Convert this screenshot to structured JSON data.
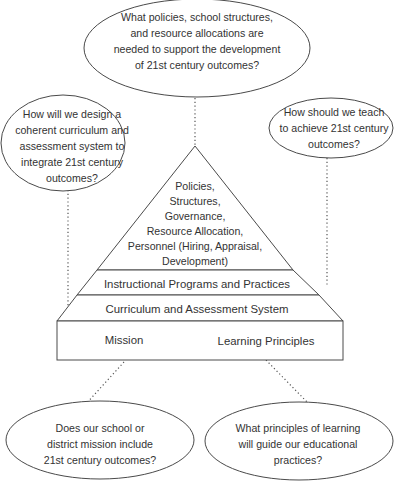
{
  "diagram": {
    "questions": {
      "top": [
        "What policies, school structures,",
        "and resource allocations are",
        "needed to support the development",
        "of 21st century outcomes?"
      ],
      "left": [
        "How will we design a",
        "coherent curriculum and",
        "assessment system to",
        "integrate 21st century",
        "outcomes?"
      ],
      "right": [
        "How should we teach",
        "to achieve 21st century",
        "outcomes?"
      ],
      "bottom_left": [
        "Does our school or",
        "district mission include",
        "21st century outcomes?"
      ],
      "bottom_right": [
        "What principles of learning",
        "will guide our educational",
        "practices?"
      ]
    },
    "pyramid": {
      "apex": [
        "Policies,",
        "Structures,",
        "Governance,",
        "Resource Allocation,",
        "Personnel (Hiring, Appraisal,",
        "Development)"
      ],
      "layer2": "Instructional Programs and Practices",
      "layer3": "Curriculum and Assessment System",
      "base_left": "Mission",
      "base_right": "Learning Principles"
    }
  }
}
